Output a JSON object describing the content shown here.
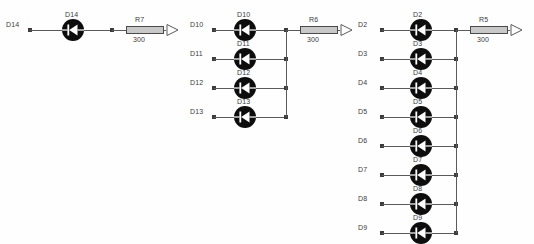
{
  "diagram": {
    "type": "circuit-schematic",
    "resistor_value_unit_implied": "ohm",
    "groups": [
      {
        "id": "group-left",
        "bus_x": 112,
        "origin_y": 30,
        "row_spacing": 29,
        "rows": [
          {
            "net_label": "D14",
            "diode_ref": "D14",
            "pin_x": 30,
            "diode_x": 62,
            "wire_end_x": 112
          }
        ],
        "resistor": {
          "ref": "R7",
          "value": "300",
          "x": 126,
          "y": 26
        },
        "port": {
          "name": "output-port",
          "x": 166,
          "y": 23
        }
      },
      {
        "id": "group-middle",
        "bus_x": 286,
        "origin_y": 30,
        "row_spacing": 29,
        "rows": [
          {
            "net_label": "D10",
            "diode_ref": "D10",
            "pin_x": 214,
            "diode_x": 234,
            "wire_end_x": 286
          },
          {
            "net_label": "D11",
            "diode_ref": "D11",
            "pin_x": 214,
            "diode_x": 234,
            "wire_end_x": 286
          },
          {
            "net_label": "D12",
            "diode_ref": "D12",
            "pin_x": 214,
            "diode_x": 234,
            "wire_end_x": 286
          },
          {
            "net_label": "D13",
            "diode_ref": "D13",
            "pin_x": 214,
            "diode_x": 234,
            "wire_end_x": 286
          }
        ],
        "resistor": {
          "ref": "R6",
          "value": "300",
          "x": 300,
          "y": 26
        },
        "port": {
          "name": "output-port",
          "x": 340,
          "y": 23
        }
      },
      {
        "id": "group-right",
        "bus_x": 456,
        "origin_y": 30,
        "row_spacing": 29,
        "rows": [
          {
            "net_label": "D2",
            "diode_ref": "D2",
            "pin_x": 382,
            "diode_x": 410,
            "wire_end_x": 456
          },
          {
            "net_label": "D3",
            "diode_ref": "D3",
            "pin_x": 382,
            "diode_x": 410,
            "wire_end_x": 456
          },
          {
            "net_label": "D4",
            "diode_ref": "D4",
            "pin_x": 382,
            "diode_x": 410,
            "wire_end_x": 456
          },
          {
            "net_label": "D5",
            "diode_ref": "D5",
            "pin_x": 382,
            "diode_x": 410,
            "wire_end_x": 456
          },
          {
            "net_label": "D6",
            "diode_ref": "D6",
            "pin_x": 382,
            "diode_x": 410,
            "wire_end_x": 456
          },
          {
            "net_label": "D7",
            "diode_ref": "D7",
            "pin_x": 382,
            "diode_x": 410,
            "wire_end_x": 456
          },
          {
            "net_label": "D8",
            "diode_ref": "D8",
            "pin_x": 382,
            "diode_x": 410,
            "wire_end_x": 456
          },
          {
            "net_label": "D9",
            "diode_ref": "D9",
            "pin_x": 382,
            "diode_x": 410,
            "wire_end_x": 456
          }
        ],
        "resistor": {
          "ref": "R5",
          "value": "300",
          "x": 470,
          "y": 26
        },
        "port": {
          "name": "output-port",
          "x": 510,
          "y": 23
        }
      }
    ],
    "colors": {
      "wire": "#5a5a5a",
      "diode_body": "#0d0d0d",
      "diode_glyph": "#ffffff",
      "resistor_fill": "#c8c8c8",
      "resistor_border": "#4a4a4a",
      "text": "#3b3b3b",
      "background": "#fefefe"
    }
  }
}
